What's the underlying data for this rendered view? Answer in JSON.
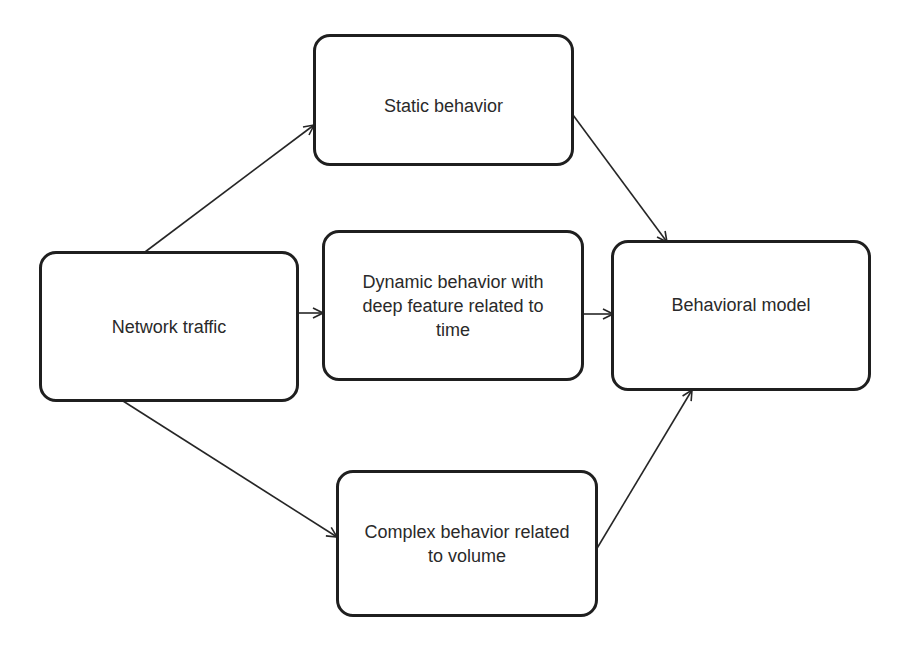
{
  "diagram": {
    "type": "flowchart",
    "colors": {
      "border": "#1f1f1f",
      "text": "#2a2a2a",
      "edge": "#262626",
      "background": "#ffffff"
    },
    "nodes": [
      {
        "id": "network_traffic",
        "label": "Network traffic"
      },
      {
        "id": "static_behavior",
        "label": "Static behavior"
      },
      {
        "id": "dynamic_behavior",
        "label": "Dynamic behavior with\ndeep feature related to\ntime"
      },
      {
        "id": "complex_behavior",
        "label": "Complex behavior related\nto volume"
      },
      {
        "id": "behavioral_model",
        "label": "Behavioral model"
      }
    ],
    "edges": [
      {
        "from": "network_traffic",
        "to": "static_behavior"
      },
      {
        "from": "network_traffic",
        "to": "dynamic_behavior"
      },
      {
        "from": "network_traffic",
        "to": "complex_behavior"
      },
      {
        "from": "static_behavior",
        "to": "behavioral_model"
      },
      {
        "from": "dynamic_behavior",
        "to": "behavioral_model"
      },
      {
        "from": "complex_behavior",
        "to": "behavioral_model"
      }
    ]
  }
}
